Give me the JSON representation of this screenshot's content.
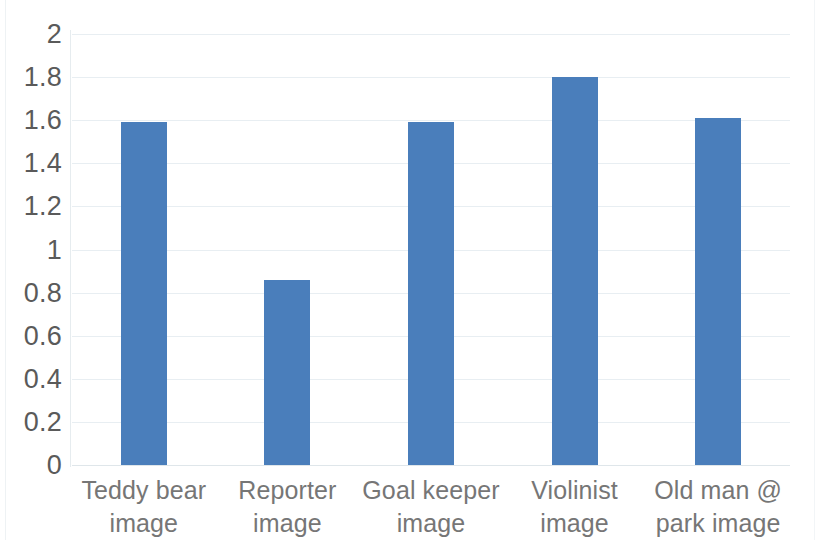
{
  "chart_data": {
    "type": "bar",
    "title": "",
    "subtitle": "",
    "xlabel": "",
    "ylabel": "",
    "categories": [
      "Teddy bear image",
      "Reporter image",
      "Goal keeper image",
      "Violinist image",
      "Old man @ park image"
    ],
    "values": [
      1.59,
      0.86,
      1.59,
      1.8,
      1.61
    ],
    "ylim": [
      0,
      2
    ],
    "ytick_values": [
      0,
      0.2,
      0.4,
      0.6,
      0.8,
      1,
      1.2,
      1.4,
      1.6,
      1.8,
      2
    ],
    "ytick_labels": [
      "0",
      "0.2",
      "0.4",
      "0.6",
      "0.8",
      "1",
      "1.2",
      "1.4",
      "1.6",
      "1.8",
      "2"
    ],
    "grid": true,
    "grid_axis": "y",
    "legend": false,
    "legend_position": "none",
    "bar_color": "#4a7ebb",
    "gridline_color": "#e8eef2",
    "tick_label_color": "#5a5a5a",
    "category_label_color": "#767676",
    "background_color": "#ffffff"
  }
}
